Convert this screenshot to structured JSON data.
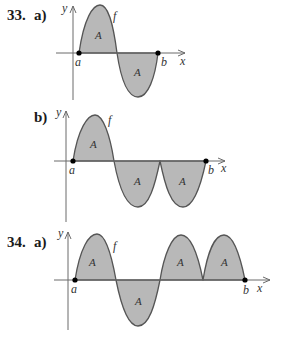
{
  "problems": [
    {
      "id": "33a",
      "number_label": "33.",
      "part_label": "a)",
      "function_label": "f",
      "y_axis_label": "y",
      "x_axis_label": "x",
      "point_a_label": "a",
      "point_b_label": "b",
      "region_labels": [
        "A",
        "A"
      ],
      "description": "Curve f from a to b: one positive hump of area A followed by one negative hump of area A"
    },
    {
      "id": "33b",
      "number_label": "",
      "part_label": "b)",
      "function_label": "f",
      "y_axis_label": "y",
      "x_axis_label": "x",
      "point_a_label": "a",
      "point_b_label": "b",
      "region_labels": [
        "A",
        "A",
        "A"
      ],
      "description": "Curve f from a to b: one positive hump of area A followed by two negative humps each of area A"
    },
    {
      "id": "34a",
      "number_label": "34.",
      "part_label": "a)",
      "function_label": "f",
      "y_axis_label": "y",
      "x_axis_label": "x",
      "point_a_label": "a",
      "point_b_label": "b",
      "region_labels": [
        "A",
        "A",
        "A",
        "A"
      ],
      "description": "Curve f from a to b: positive hump A, negative hump A, then two positive humps each of area A"
    }
  ],
  "colors": {
    "shading": "#b8b8b8",
    "curve": "#555555",
    "axis": "#6a6a6a",
    "text": "#1a1a1a"
  }
}
